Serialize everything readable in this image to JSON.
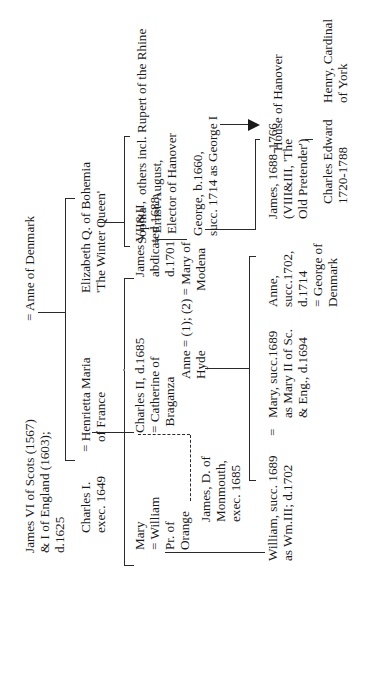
{
  "diagram": {
    "type": "family-tree",
    "orientation": "rotated-90-ccw",
    "root": {
      "person": "James VI of Scots (1567)\n& I of England (1603);\nd.1625",
      "spouse": "= Anne of Denmark"
    },
    "gen2": {
      "charles_i": "Charles I.\nexec. 1649",
      "charles_i_spouse": "= Henrietta Maria\n   of France",
      "elizabeth": "Elizabeth Q. of Bohemia\n'The Winter Queen'"
    },
    "gen3": {
      "mary": "Mary\n= William\nPr. of\nOrange",
      "charles_ii": "Charles II, d.1685\n= Catherine of\n  Braganza",
      "james_ii": "James VII&II,\nabdicated 1688,\nd.1701",
      "james_ii_spouses": "Anne = (1); (2) = Mary of\nHyde                  Modena",
      "sophia": "Sophia\n= Ernst-August,\n   Elector of Hanover",
      "others": "others incl. Rupert of the Rhine"
    },
    "gen4": {
      "monmouth": "James, D. of\nMonmouth,\nexec. 1685",
      "william": "William, succ. 1689\nas Wm.III; d.1702",
      "marriage_sign": "=",
      "mary_ii": "Mary, succ.1689\nas Mary II of Sc.\n& Eng., d.1694",
      "anne": "Anne,\nsucc.1702,\nd.1714\n= George of\nDenmark",
      "old_pretender": "James, 1688-1766\n(VIII&III, 'The\nOld Pretender')",
      "george_i": "George, b.1660,\nsucc. 1714 as George I"
    },
    "gen5": {
      "house_of_hanover": "House of Hanover",
      "charles_edward": "Charles Edward\n1720-1788",
      "henry": "Henry, Cardinal\nof York"
    },
    "signs": {
      "eq": "=",
      "mary_eq": "="
    }
  }
}
